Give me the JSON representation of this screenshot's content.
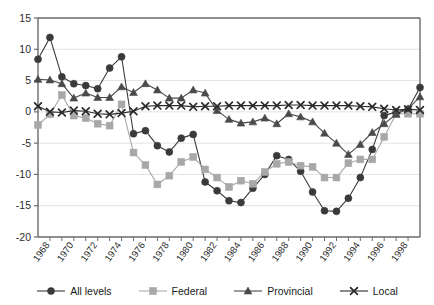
{
  "chart_data": {
    "type": "line",
    "title": "",
    "xlabel": "",
    "ylabel": "",
    "xlim": [
      1967,
      1999
    ],
    "ylim": [
      -20,
      15
    ],
    "ytick_values": [
      15,
      10,
      5,
      0,
      -5,
      -10,
      -15,
      -20
    ],
    "ytick_labels": [
      "15",
      "10",
      "5",
      "0",
      "-5",
      "-10",
      "-15",
      "-20"
    ],
    "xtick_values": [
      1968,
      1970,
      1972,
      1974,
      1976,
      1978,
      1980,
      1982,
      1984,
      1986,
      1988,
      1990,
      1992,
      1994,
      1996,
      1998
    ],
    "xtick_labels": [
      "1968",
      "1970",
      "1972",
      "1974",
      "1976",
      "1978",
      "1980",
      "1982",
      "1984",
      "1986",
      "1988",
      "1990",
      "1992",
      "1994",
      "1996",
      "1998"
    ],
    "x": [
      1967,
      1968,
      1969,
      1970,
      1971,
      1972,
      1973,
      1974,
      1975,
      1976,
      1977,
      1978,
      1979,
      1980,
      1981,
      1982,
      1983,
      1984,
      1985,
      1986,
      1987,
      1988,
      1989,
      1990,
      1991,
      1992,
      1993,
      1994,
      1995,
      1996,
      1997,
      1998,
      1999
    ],
    "grid": true,
    "grid_axis": "y",
    "legend_position": "bottom",
    "series": [
      {
        "name": "All levels",
        "color": "#3a3a3a",
        "marker": "circle",
        "values": [
          8.4,
          11.9,
          5.6,
          4.5,
          4.2,
          3.7,
          7.0,
          8.8,
          -3.5,
          -3.0,
          -5.4,
          -6.4,
          -4.2,
          -3.6,
          -11.2,
          -12.6,
          -14.2,
          -14.5,
          -12.2,
          -10.0,
          -7.0,
          -7.6,
          -9.5,
          -12.8,
          -15.8,
          -15.9,
          -13.8,
          -10.5,
          -6.0,
          -0.6,
          0.0,
          0.4,
          3.9
        ]
      },
      {
        "name": "Federal",
        "color": "#a8a8a8",
        "marker": "square",
        "values": [
          -2.1,
          -0.4,
          2.7,
          -0.6,
          -1.0,
          -1.9,
          -2.2,
          1.2,
          -6.5,
          -8.5,
          -11.6,
          -10.2,
          -8.0,
          -7.2,
          -9.2,
          -10.5,
          -12.0,
          -11.0,
          -11.5,
          -9.6,
          -8.3,
          -8.0,
          -8.6,
          -8.8,
          -10.5,
          -10.5,
          -8.2,
          -7.6,
          -7.6,
          -4.0,
          -0.3,
          -0.3,
          -0.3
        ]
      },
      {
        "name": "Provincial",
        "color": "#4a4a4a",
        "marker": "triangle",
        "values": [
          5.2,
          5.1,
          4.5,
          2.2,
          3.0,
          2.3,
          2.3,
          4.0,
          3.1,
          4.5,
          3.5,
          2.2,
          2.2,
          3.5,
          3.0,
          0.2,
          -1.2,
          -1.8,
          -1.6,
          -1.0,
          -1.9,
          -0.3,
          -0.8,
          -1.6,
          -3.4,
          -5.0,
          -6.8,
          -5.2,
          -3.3,
          -1.9,
          -0.4,
          0.5,
          2.4
        ]
      },
      {
        "name": "Local",
        "color": "#2b2b2b",
        "marker": "x",
        "values": [
          0.9,
          0.0,
          -0.1,
          0.2,
          0.1,
          -0.3,
          -0.4,
          -0.2,
          0.1,
          0.9,
          1.0,
          1.0,
          1.0,
          0.8,
          0.9,
          0.9,
          1.0,
          1.0,
          1.0,
          1.0,
          1.0,
          1.1,
          1.1,
          1.0,
          1.0,
          1.0,
          1.0,
          0.9,
          0.8,
          0.5,
          0.3,
          0.4,
          0.3
        ]
      }
    ]
  },
  "legend": {
    "items": [
      {
        "label": "All levels"
      },
      {
        "label": "Federal"
      },
      {
        "label": "Provincial"
      },
      {
        "label": "Local"
      }
    ]
  }
}
